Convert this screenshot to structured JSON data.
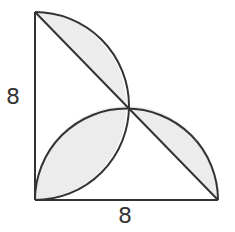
{
  "diagram": {
    "type": "geometry",
    "labels": {
      "left_leg": "8",
      "bottom_leg": "8"
    },
    "colors": {
      "stroke": "#333333",
      "fill": "#ececec",
      "background": "#ffffff"
    },
    "points": {
      "A_top": [
        35,
        12
      ],
      "B_right_angle": [
        35,
        200
      ],
      "C_bottom_right": [
        218,
        200
      ],
      "M_hypotenuse_midpoint": [
        126.5,
        106
      ]
    }
  }
}
